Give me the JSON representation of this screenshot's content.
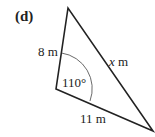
{
  "figure": {
    "part_label": "(d)",
    "side_left": "8 m",
    "side_bottom": "11 m",
    "side_unknown_var": "x",
    "side_unknown_unit": " m",
    "angle": "110°"
  }
}
